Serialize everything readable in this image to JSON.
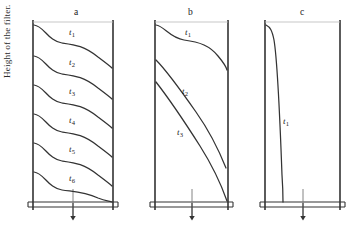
{
  "figure": {
    "width": 362,
    "height": 230,
    "background": "#ffffff",
    "ink_color": "#333333",
    "axis_label": "Height of the filter."
  },
  "panels": [
    {
      "id": "a",
      "title": "a",
      "title_pos": {
        "x": 74,
        "y": 7
      },
      "box": {
        "left": 33,
        "right": 113,
        "top": 22,
        "bottom": 202,
        "base2": 207
      },
      "outlet_arrow": {
        "x": 73,
        "y_start": 203,
        "y_end": 222
      },
      "curves": [
        {
          "label": "t",
          "sub": "1",
          "label_pos": {
            "x": 69,
            "y": 27
          },
          "path": "M 34 25 C 44 26 48 41 62 43 C 76 45 84 46 98 57 C 106 63 110 66 112 68"
        },
        {
          "label": "t",
          "sub": "2",
          "label_pos": {
            "x": 69,
            "y": 57
          },
          "path": "M 34 56 C 44 57 48 72 62 74 C 76 76 84 77 98 88 C 106 94 110 97 112 99"
        },
        {
          "label": "t",
          "sub": "3",
          "label_pos": {
            "x": 69,
            "y": 86
          },
          "path": "M 34 85 C 44 86 48 101 62 103 C 76 105 84 106 98 117 C 106 123 110 126 112 128"
        },
        {
          "label": "t",
          "sub": "4",
          "label_pos": {
            "x": 69,
            "y": 115
          },
          "path": "M 34 114 C 44 115 48 130 62 132 C 76 134 84 135 98 146 C 106 152 110 155 112 157"
        },
        {
          "label": "t",
          "sub": "5",
          "label_pos": {
            "x": 69,
            "y": 144
          },
          "path": "M 34 143 C 44 144 48 159 62 161 C 76 163 84 164 98 175 C 106 181 110 184 112 186"
        },
        {
          "label": "t",
          "sub": "6",
          "label_pos": {
            "x": 69,
            "y": 173
          },
          "path": "M 34 172 C 44 173 48 188 62 190 C 76 192 84 192 98 198 C 106 201 110 201 112 202"
        }
      ]
    },
    {
      "id": "b",
      "title": "b",
      "title_pos": {
        "x": 188,
        "y": 7
      },
      "box": {
        "left": 155,
        "right": 228,
        "top": 22,
        "bottom": 202,
        "base2": 207
      },
      "outlet_arrow": {
        "x": 192,
        "y_start": 203,
        "y_end": 222
      },
      "curves": [
        {
          "label": "t",
          "sub": "1",
          "label_pos": {
            "x": 185,
            "y": 27
          },
          "path": "M 156 25 C 164 26 170 38 184 40 C 200 42 210 46 218 56 C 223 62 226 66 227 70"
        },
        {
          "label": "t",
          "sub": "2",
          "label_pos": {
            "x": 182,
            "y": 86
          },
          "path": "M 156 60 C 168 72 182 92 196 112 C 208 129 218 148 226 168"
        },
        {
          "label": "t",
          "sub": "3",
          "label_pos": {
            "x": 177,
            "y": 127
          },
          "path": "M 156 82 C 170 100 186 124 200 146 C 212 165 221 184 227 201"
        }
      ]
    },
    {
      "id": "c",
      "title": "c",
      "title_pos": {
        "x": 300,
        "y": 7
      },
      "box": {
        "left": 265,
        "right": 340,
        "top": 22,
        "bottom": 202,
        "base2": 207
      },
      "outlet_arrow": {
        "x": 303,
        "y_start": 203,
        "y_end": 222
      },
      "curves": [
        {
          "label": "t",
          "sub": "1",
          "label_pos": {
            "x": 283,
            "y": 116
          },
          "path": "M 266 25 C 270 27 272 30 274 40 C 277 58 280 120 282 175 C 283 190 283 197 283 202"
        }
      ]
    }
  ]
}
